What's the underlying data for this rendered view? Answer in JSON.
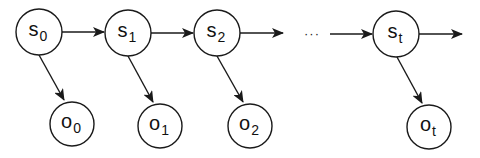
{
  "diagram": {
    "type": "hidden-markov-chain",
    "stroke_color": "#1a1a1a",
    "states": [
      {
        "id": "s0",
        "base": "s",
        "sub": "0",
        "cx": 39,
        "cy": 32,
        "r": 23
      },
      {
        "id": "s1",
        "base": "s",
        "sub": "1",
        "cx": 128,
        "cy": 33,
        "r": 23
      },
      {
        "id": "s2",
        "base": "s",
        "sub": "2",
        "cx": 217,
        "cy": 33,
        "r": 23
      },
      {
        "id": "st",
        "base": "s",
        "sub": "t",
        "cx": 396,
        "cy": 34,
        "r": 23
      }
    ],
    "observations": [
      {
        "id": "o0",
        "base": "o",
        "sub": "0",
        "cx": 72,
        "cy": 124,
        "r": 22
      },
      {
        "id": "o1",
        "base": "o",
        "sub": "1",
        "cx": 160,
        "cy": 126,
        "r": 22
      },
      {
        "id": "o2",
        "base": "o",
        "sub": "2",
        "cx": 250,
        "cy": 126,
        "r": 22
      },
      {
        "id": "ot",
        "base": "o",
        "sub": "t",
        "cx": 429,
        "cy": 127,
        "r": 22
      }
    ],
    "ellipsis": {
      "text": "···",
      "x": 312,
      "y": 33
    },
    "transitions": [
      {
        "from": "s0",
        "to": "s1"
      },
      {
        "from": "s1",
        "to": "s2"
      },
      {
        "from": "s2",
        "to": "ellipsis"
      },
      {
        "from": "ellipsis",
        "to": "st"
      },
      {
        "from": "st",
        "to": "out"
      }
    ],
    "emissions": [
      {
        "from": "s0",
        "to": "o0"
      },
      {
        "from": "s1",
        "to": "o1"
      },
      {
        "from": "s2",
        "to": "o2"
      },
      {
        "from": "st",
        "to": "ot"
      }
    ]
  }
}
